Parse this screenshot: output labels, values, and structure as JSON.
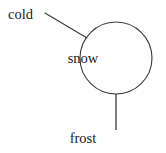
{
  "diagram": {
    "type": "concept-map",
    "background_color": "#ffffff",
    "stroke_color": "#3a3a3a",
    "text_color": "#1a1a1a",
    "central_node": {
      "label": "snow",
      "shape": "circle",
      "center_x": 116,
      "center_y": 58,
      "radius": 36
    },
    "peripheral_nodes": [
      {
        "id": "cold",
        "label": "cold",
        "position": "upper-left",
        "connector": "diagonal-line"
      },
      {
        "id": "frost",
        "label": "frost",
        "position": "bottom",
        "connector": "vertical-line"
      }
    ],
    "edges": [
      {
        "from": "cold",
        "to": "snow",
        "x1": 45,
        "y1": 13,
        "x2": 87,
        "y2": 38
      },
      {
        "from": "snow",
        "to": "frost",
        "x1": 116,
        "y1": 94,
        "x2": 116,
        "y2": 130
      }
    ]
  }
}
